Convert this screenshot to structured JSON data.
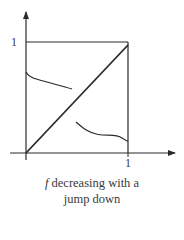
{
  "diagram": {
    "type": "function-graph",
    "y_axis_label_top": "1",
    "x_axis_label_right": "1",
    "colors": {
      "stroke": "#2a2a2a",
      "text": "#3a3a3a",
      "background": "#ffffff"
    },
    "elements": {
      "unit_square": "box from (0,0) to (1,1)",
      "diagonal": "line y = x",
      "upper_branch": "decreasing curve starting near y=0.75 at x=0, ending near y=0.6 at x≈0.45",
      "lower_branch": "decreasing curve starting near y=0.3 at x≈0.5, ending near y=0.1 at x=1"
    }
  },
  "caption": {
    "variable": "f",
    "line1_rest": " decreasing with a",
    "line2": "jump down"
  }
}
